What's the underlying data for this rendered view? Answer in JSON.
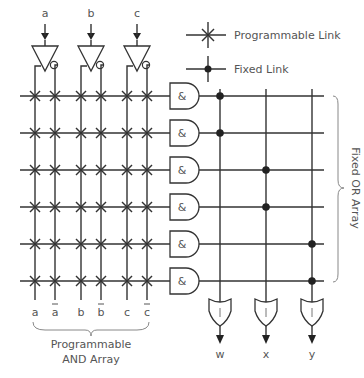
{
  "legend": {
    "programmable_link": "Programmable Link",
    "fixed_link": "Fixed Link"
  },
  "inputs": [
    {
      "name": "a",
      "x": 35,
      "inv_x": 55
    },
    {
      "name": "b",
      "x": 81,
      "inv_x": 101
    },
    {
      "name": "c",
      "x": 127,
      "inv_x": 147
    }
  ],
  "column_labels": [
    {
      "text": "a",
      "bar": false,
      "x": 35
    },
    {
      "text": "a",
      "bar": true,
      "x": 55
    },
    {
      "text": "b",
      "bar": false,
      "x": 81
    },
    {
      "text": "b",
      "bar": true,
      "x": 101
    },
    {
      "text": "c",
      "bar": false,
      "x": 127
    },
    {
      "text": "c",
      "bar": true,
      "x": 147
    }
  ],
  "and_rows": [
    96,
    133,
    170,
    207,
    244,
    281
  ],
  "and_gate_symbol": "&",
  "or_gate_symbol": "|",
  "outputs": [
    {
      "name": "w",
      "x": 220
    },
    {
      "name": "x",
      "x": 266
    },
    {
      "name": "y",
      "x": 312
    }
  ],
  "fixed_links": [
    {
      "row": 0,
      "output": 0
    },
    {
      "row": 1,
      "output": 0
    },
    {
      "row": 2,
      "output": 1
    },
    {
      "row": 3,
      "output": 1
    },
    {
      "row": 4,
      "output": 2
    },
    {
      "row": 5,
      "output": 2
    }
  ],
  "and_array_label": [
    "Programmable",
    "AND Array"
  ],
  "or_array_label": "Fixed OR Array",
  "colors": {
    "line": "#333333",
    "text": "#555555",
    "brace": "#888888"
  }
}
